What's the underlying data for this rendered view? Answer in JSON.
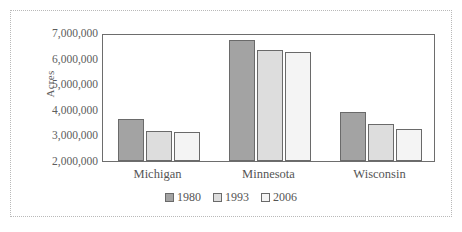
{
  "chart_data": {
    "type": "bar",
    "title": "",
    "subtitle": "",
    "xlabel": "",
    "ylabel": "Acres",
    "categories": [
      "Michigan",
      "Minnesota",
      "Wisconsin"
    ],
    "series": [
      {
        "name": "1980",
        "color": "#a3a3a3",
        "values": [
          3650000,
          6720000,
          3900000
        ]
      },
      {
        "name": "1993",
        "color": "#dddddd",
        "values": [
          3170000,
          6320000,
          3450000
        ]
      },
      {
        "name": "2006",
        "color": "#f4f4f4",
        "values": [
          3120000,
          6250000,
          3250000
        ]
      }
    ],
    "ylim": [
      2000000,
      7000000
    ],
    "ytick_labels": [
      "7,000,000",
      "6,000,000",
      "5,000,000",
      "4,000,000",
      "3,000,000",
      "2,000,000"
    ],
    "ytick_values": [
      7000000,
      6000000,
      5000000,
      4000000,
      3000000,
      2000000
    ],
    "grid": false,
    "legend_position": "bottom",
    "frame": true
  }
}
